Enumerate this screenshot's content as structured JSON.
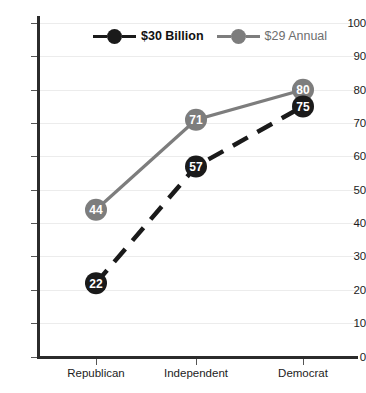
{
  "chart_data": {
    "type": "line",
    "title": "",
    "subtitle": "",
    "xlabel": "",
    "ylabel": "",
    "categories": [
      "Republican",
      "Independent",
      "Democrat"
    ],
    "ylim": [
      0,
      100
    ],
    "yticks": [
      0,
      10,
      20,
      30,
      40,
      50,
      60,
      70,
      80,
      90,
      100
    ],
    "grid": true,
    "legend_position": "top-center",
    "series": [
      {
        "name": "$30 Billion",
        "values": [
          22,
          57,
          75
        ],
        "color": "#1a1a1a",
        "line_style": "dashed",
        "marker": "circle",
        "label_color": "#ffffff",
        "legend_bold": true
      },
      {
        "name": "$29 Annual",
        "values": [
          44,
          71,
          80
        ],
        "color": "#7d7d7d",
        "line_style": "solid",
        "marker": "circle",
        "label_color": "#ffffff",
        "legend_bold": false
      }
    ]
  },
  "axes": {
    "y_tick_labels": [
      "100",
      "90",
      "80",
      "70",
      "60",
      "50",
      "40",
      "30",
      "20",
      "10",
      "0"
    ],
    "x_tick_labels": [
      "Republican",
      "Independent",
      "Democrat"
    ]
  },
  "legend": {
    "entries": [
      {
        "label": "$30 Billion",
        "color": "#1a1a1a"
      },
      {
        "label": "$29 Annual",
        "color": "#7d7d7d"
      }
    ]
  },
  "markers": {
    "series1": [
      {
        "label": "22"
      },
      {
        "label": "57"
      },
      {
        "label": "75"
      }
    ],
    "series2": [
      {
        "label": "44"
      },
      {
        "label": "71"
      },
      {
        "label": "80"
      }
    ]
  },
  "colors": {
    "series1": "#1a1a1a",
    "series2": "#7d7d7d",
    "axis": "#2b2b2b",
    "grid": "#ececec",
    "text": "#1c1c1c",
    "marker_text": "#ffffff"
  }
}
